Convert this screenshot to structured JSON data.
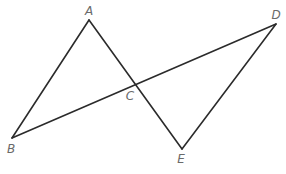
{
  "diagram": {
    "type": "geometry",
    "points": {
      "A": {
        "label": "A",
        "x": 89,
        "y": 20,
        "label_x": 89,
        "label_y": 15
      },
      "B": {
        "label": "B",
        "x": 12,
        "y": 138,
        "label_x": 11,
        "label_y": 153
      },
      "C": {
        "label": "C",
        "x": 135,
        "y": 83,
        "label_x": 130,
        "label_y": 100
      },
      "D": {
        "label": "D",
        "x": 276,
        "y": 24,
        "label_x": 276,
        "label_y": 19
      },
      "E": {
        "label": "E",
        "x": 182,
        "y": 149,
        "label_x": 181,
        "label_y": 163
      }
    },
    "segments": [
      {
        "from": "A",
        "to": "B"
      },
      {
        "from": "A",
        "to": "E"
      },
      {
        "from": "B",
        "to": "D"
      },
      {
        "from": "D",
        "to": "E"
      }
    ],
    "colors": {
      "line": "#2b2b2b",
      "label": "#6a6a6a",
      "background": "#ffffff"
    }
  }
}
